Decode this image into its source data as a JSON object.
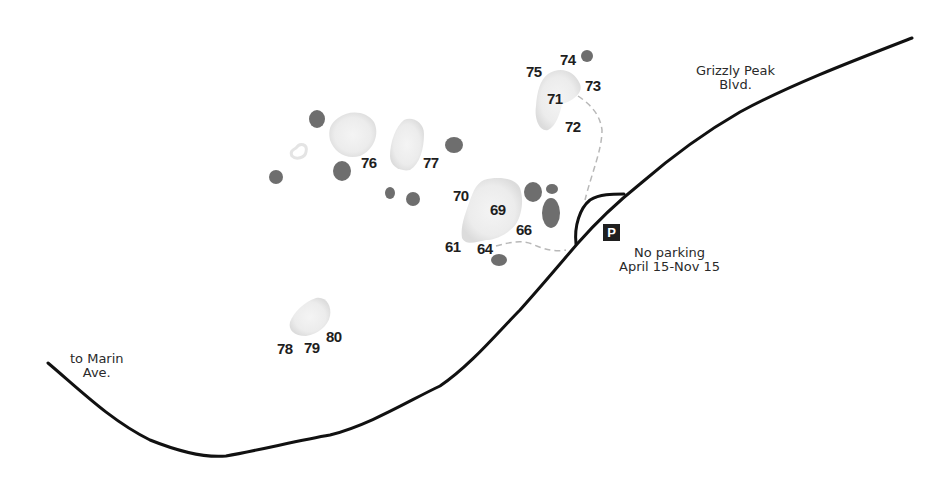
{
  "map": {
    "roads": {
      "main_road_name": "Grizzly Peak Blvd.",
      "main_road_label_line1": "Grizzly Peak",
      "main_road_label_line2": "Blvd.",
      "side_road_label_line1": "to Marin",
      "side_road_label_line2": "Ave."
    },
    "parking": {
      "icon": "P",
      "note_line1": "No parking",
      "note_line2": "April 15-Nov 15"
    },
    "boulder_numbers": [
      {
        "id": "n74",
        "label": "74"
      },
      {
        "id": "n75",
        "label": "75"
      },
      {
        "id": "n73",
        "label": "73"
      },
      {
        "id": "n71",
        "label": "71"
      },
      {
        "id": "n72",
        "label": "72"
      },
      {
        "id": "n76",
        "label": "76"
      },
      {
        "id": "n77",
        "label": "77"
      },
      {
        "id": "n70",
        "label": "70"
      },
      {
        "id": "n69",
        "label": "69"
      },
      {
        "id": "n66",
        "label": "66"
      },
      {
        "id": "n61",
        "label": "61"
      },
      {
        "id": "n64",
        "label": "64"
      },
      {
        "id": "n78",
        "label": "78"
      },
      {
        "id": "n79",
        "label": "79"
      },
      {
        "id": "n80",
        "label": "80"
      }
    ],
    "colors": {
      "road": "#111111",
      "trail": "#b8b8b8",
      "dark_boulder": "#6e6e6e",
      "light_boulder": "#e6e6e6",
      "parking_bg": "#1f1f1f"
    }
  }
}
